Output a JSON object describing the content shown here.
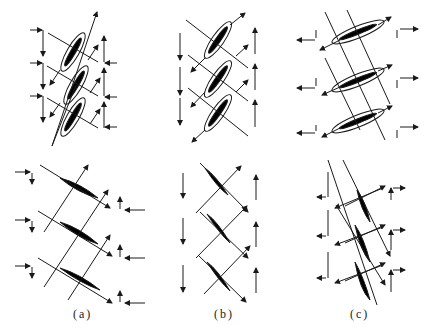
{
  "figure": {
    "panels": [
      {
        "id": "a",
        "caption": "(a)"
      },
      {
        "id": "b",
        "caption": "(b)"
      },
      {
        "id": "c",
        "caption": "(c)"
      }
    ],
    "colors": {
      "line": "#1a1a1a",
      "fill": "#000000",
      "background": "#ffffff"
    }
  }
}
